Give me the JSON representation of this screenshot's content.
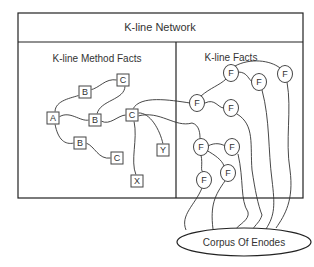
{
  "diagram": {
    "title": "K-line Network",
    "panels": {
      "left": {
        "title": "K-line Method Facts"
      },
      "right": {
        "title": "K-line Facts"
      }
    },
    "method_nodes": [
      {
        "id": "c1",
        "label": "C",
        "x": 123,
        "y": 80
      },
      {
        "id": "b1",
        "label": "B",
        "x": 85,
        "y": 92
      },
      {
        "id": "a",
        "label": "A",
        "x": 53,
        "y": 118
      },
      {
        "id": "b2",
        "label": "B",
        "x": 95,
        "y": 120
      },
      {
        "id": "c2",
        "label": "C",
        "x": 132,
        "y": 115
      },
      {
        "id": "b3",
        "label": "B",
        "x": 80,
        "y": 143
      },
      {
        "id": "c3",
        "label": "C",
        "x": 117,
        "y": 158
      },
      {
        "id": "y",
        "label": "Y",
        "x": 163,
        "y": 150
      },
      {
        "id": "x",
        "label": "X",
        "x": 137,
        "y": 181
      }
    ],
    "fact_nodes": [
      {
        "id": "f1",
        "label": "F",
        "x": 231,
        "y": 73
      },
      {
        "id": "f2",
        "label": "F",
        "x": 259,
        "y": 82
      },
      {
        "id": "f3",
        "label": "F",
        "x": 285,
        "y": 74
      },
      {
        "id": "f4",
        "label": "F",
        "x": 197,
        "y": 103
      },
      {
        "id": "f5",
        "label": "F",
        "x": 231,
        "y": 108
      },
      {
        "id": "f6",
        "label": "F",
        "x": 201,
        "y": 147
      },
      {
        "id": "f7",
        "label": "F",
        "x": 232,
        "y": 147
      },
      {
        "id": "f8",
        "label": "F",
        "x": 204,
        "y": 180
      },
      {
        "id": "f9",
        "label": "F",
        "x": 228,
        "y": 173
      }
    ],
    "corpus": {
      "label": "Corpus Of Enodes"
    },
    "colors": {
      "stroke": "#333333",
      "background": "#ffffff",
      "text": "#333333"
    }
  }
}
